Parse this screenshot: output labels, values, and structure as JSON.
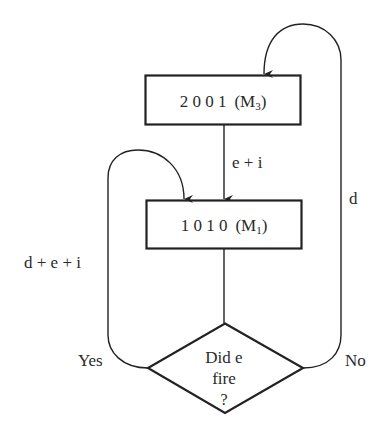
{
  "diagram": {
    "type": "flowchart",
    "nodes": {
      "m3": {
        "digits": "2 0 0 1",
        "label_open": "(M",
        "subscript": "3",
        "label_close": ")"
      },
      "m1": {
        "digits": "1 0 1 0",
        "label_open": "(M",
        "subscript": "1",
        "label_close": ")"
      },
      "decision": {
        "line1": "Did e",
        "line2": "fire",
        "line3": "?"
      }
    },
    "edges": {
      "m3_to_m1": "e + i",
      "yes_loop": "d + e + i",
      "no_loop": "d",
      "yes_branch": "Yes",
      "no_branch": "No"
    },
    "colors": {
      "stroke": "#222222",
      "text": "#2a2a2a",
      "background": "#ffffff"
    }
  }
}
